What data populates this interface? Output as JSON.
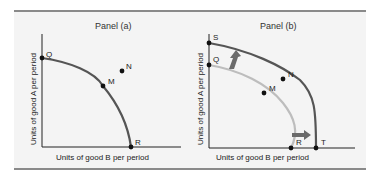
{
  "panels": [
    {
      "title": "Panel (a)",
      "x_axis_label": "Units of good B per period",
      "y_axis_label": "Units of good A per period",
      "points": {
        "Q": "Q",
        "M": "M",
        "N": "N",
        "R": "R"
      }
    },
    {
      "title": "Panel (b)",
      "x_axis_label": "Units of good B per period",
      "y_axis_label": "Units of good A per period",
      "points": {
        "S": "S",
        "Q": "Q",
        "N": "N",
        "M": "M",
        "R": "R",
        "T": "T"
      }
    }
  ],
  "colors": {
    "curve_dark": "#555555",
    "curve_light": "#bdbdbd",
    "arrow": "#6b6b6b",
    "axis": "#222222",
    "frame": "#f4f4f4",
    "rule": "#8a8a8a"
  }
}
